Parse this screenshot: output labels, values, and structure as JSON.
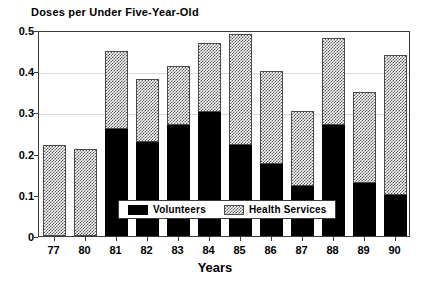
{
  "chart_data": {
    "type": "bar",
    "stacked": true,
    "title": "Doses per Under Five-Year-Old",
    "xlabel": "Years",
    "ylabel": "",
    "categories": [
      "77",
      "80",
      "81",
      "82",
      "83",
      "84",
      "85",
      "86",
      "87",
      "88",
      "89",
      "90"
    ],
    "series": [
      {
        "name": "Volunteers",
        "color": "#000000",
        "pattern": "solid",
        "values": [
          0.0,
          0.0,
          0.26,
          0.228,
          0.27,
          0.3,
          0.222,
          0.175,
          0.122,
          0.27,
          0.128,
          0.1
        ]
      },
      {
        "name": "Health Services",
        "color": "#5a5a5a",
        "pattern": "hatch",
        "values": [
          0.22,
          0.212,
          0.19,
          0.152,
          0.142,
          0.168,
          0.268,
          0.225,
          0.182,
          0.21,
          0.222,
          0.34
        ]
      }
    ],
    "totals": [
      0.22,
      0.212,
      0.45,
      0.38,
      0.412,
      0.468,
      0.49,
      0.4,
      0.304,
      0.48,
      0.35,
      0.44
    ],
    "ylim": [
      0,
      0.5
    ],
    "yticks": [
      0,
      0.1,
      0.2,
      0.3,
      0.4,
      0.5
    ],
    "ytick_labels": [
      "0",
      "0.1",
      "0.2",
      "0.3",
      "0.4",
      "0.5"
    ],
    "gridlines": [
      0.3,
      0.4
    ],
    "grid": true,
    "legend_position": "inside-bottom-center",
    "legend": [
      {
        "label": "Volunteers",
        "swatch": "solid"
      },
      {
        "label": "Health Services",
        "swatch": "hatch"
      }
    ]
  }
}
